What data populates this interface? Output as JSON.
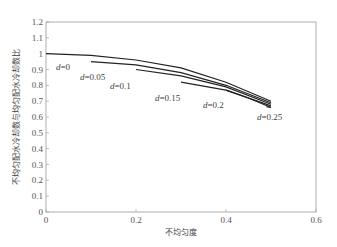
{
  "chart_data": {
    "type": "line",
    "title": "",
    "xlabel": "不均匀度",
    "ylabel": "不均匀配水冷却数与均匀配水冷却数比",
    "xlim": [
      0,
      0.6
    ],
    "ylim": [
      0,
      1.2
    ],
    "xticks": [
      "0",
      "0.2",
      "0.4",
      "0.6"
    ],
    "yticks": [
      "0",
      "0.1",
      "0.2",
      "0.3",
      "0.4",
      "0.5",
      "0.6",
      "0.7",
      "0.8",
      "0.9",
      "1",
      "1.1",
      "1.2"
    ],
    "grid": false,
    "legend": "inline labels",
    "series": [
      {
        "name": "d=0",
        "label_var": "d",
        "label_val": "=0",
        "x": [
          0,
          0.1,
          0.2,
          0.3,
          0.4,
          0.5
        ],
        "y": [
          1.0,
          0.99,
          0.96,
          0.91,
          0.82,
          0.7
        ]
      },
      {
        "name": "d=0.05",
        "label_var": "d",
        "label_val": "=0.05",
        "x": [
          0.1,
          0.2,
          0.3,
          0.4,
          0.5
        ],
        "y": [
          0.95,
          0.93,
          0.88,
          0.8,
          0.69
        ]
      },
      {
        "name": "d=0.1",
        "label_var": "d",
        "label_val": "=0.1",
        "x": [
          0.2,
          0.3,
          0.4,
          0.5
        ],
        "y": [
          0.9,
          0.86,
          0.79,
          0.68
        ]
      },
      {
        "name": "d=0.15",
        "label_var": "d",
        "label_val": "=0.15",
        "x": [
          0.3,
          0.4,
          0.5
        ],
        "y": [
          0.82,
          0.77,
          0.67
        ]
      },
      {
        "name": "d=0.2",
        "label_var": "d",
        "label_val": "=0.2",
        "x": [
          0.4,
          0.45,
          0.5
        ],
        "y": [
          0.77,
          0.72,
          0.66
        ]
      },
      {
        "name": "d=0.25",
        "label_var": "d",
        "label_val": "=0.25",
        "x": [
          0.49,
          0.5
        ],
        "y": [
          0.665,
          0.66
        ]
      }
    ]
  }
}
